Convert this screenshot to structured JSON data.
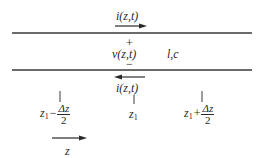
{
  "diagram": {
    "type": "transmission-line-segment",
    "conductors": {
      "color": "#3a3a3a"
    },
    "labels": {
      "current_top": "i(z,t)",
      "plus": "+",
      "voltage": "v(z,t)",
      "minus": "−",
      "params": "l,c",
      "current_bottom": "i(z,t)",
      "z_axis": "z"
    },
    "positions": {
      "left": {
        "var": "z",
        "sub": "1",
        "op": "−",
        "num": "Δz",
        "den": "2"
      },
      "center": {
        "var": "z",
        "sub": "1"
      },
      "right": {
        "var": "z",
        "sub": "1",
        "op": "+",
        "num": "Δz",
        "den": "2"
      }
    },
    "arrows": {
      "current_top": "right",
      "current_bottom": "left",
      "z_axis": "right"
    }
  }
}
